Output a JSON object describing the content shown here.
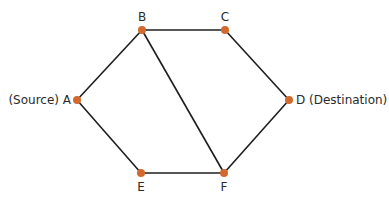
{
  "graph": {
    "nodes": [
      {
        "id": "A",
        "label": "(Source) A",
        "role": "source"
      },
      {
        "id": "B",
        "label": "B"
      },
      {
        "id": "C",
        "label": "C"
      },
      {
        "id": "D",
        "label": "D (Destination)",
        "role": "destination"
      },
      {
        "id": "E",
        "label": "E"
      },
      {
        "id": "F",
        "label": "F"
      }
    ],
    "edges": [
      {
        "from": "A",
        "to": "B"
      },
      {
        "from": "B",
        "to": "C"
      },
      {
        "from": "C",
        "to": "D"
      },
      {
        "from": "D",
        "to": "F"
      },
      {
        "from": "F",
        "to": "E"
      },
      {
        "from": "E",
        "to": "A"
      },
      {
        "from": "B",
        "to": "F"
      }
    ],
    "node_color": "#d2692e",
    "edge_color": "#1e1e1e"
  }
}
